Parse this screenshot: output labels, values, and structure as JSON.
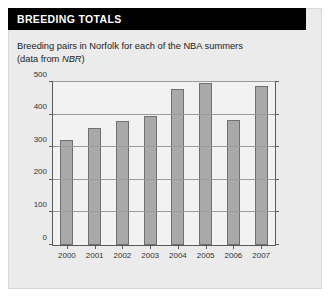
{
  "panel": {
    "title": "BREEDING TOTALS",
    "subtitle_line1": "Breeding pairs in Norfolk for each of the NBA summers",
    "subtitle_line2_prefix": "(data from ",
    "subtitle_line2_italic": "NBR",
    "subtitle_line2_suffix": ")"
  },
  "colors": {
    "title_bar": "#000000",
    "title_text": "#ffffff",
    "panel_bg": "#ebebeb",
    "plot_bg": "#f2f2f2",
    "bar_fill": "#a9a9a9",
    "bar_border": "#6f6f6f",
    "axis": "#5a5a5a",
    "grid": "#9a9a9a"
  },
  "chart_data": {
    "type": "bar",
    "title": "BREEDING TOTALS",
    "subtitle": "Breeding pairs in Norfolk for each of the NBA summers (data from NBR)",
    "xlabel": "",
    "ylabel": "",
    "categories": [
      "2000",
      "2001",
      "2002",
      "2003",
      "2004",
      "2005",
      "2006",
      "2007"
    ],
    "values": [
      322,
      358,
      380,
      397,
      478,
      497,
      383,
      487
    ],
    "ylim": [
      0,
      500
    ],
    "yticks": [
      0,
      100,
      200,
      300,
      400,
      500
    ],
    "grid": true,
    "legend": "none",
    "series": [
      {
        "name": "Breeding pairs",
        "values": [
          322,
          358,
          380,
          397,
          478,
          497,
          383,
          487
        ]
      }
    ]
  }
}
